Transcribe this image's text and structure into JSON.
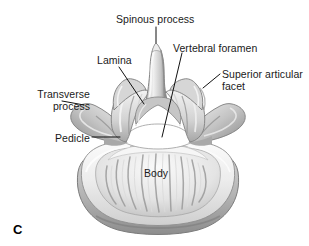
{
  "figure": {
    "panel_letter": "C",
    "background_color": "#ffffff",
    "label_color": "#1a1a1a",
    "leader_color": "#111111",
    "bone_light": "#f2f2f2",
    "bone_mid": "#c9c9c9",
    "bone_shadow": "#8f8f8f",
    "bone_dark": "#6a6a6a",
    "foramen_color": "#ffffff"
  },
  "labels": [
    {
      "id": "spinous-process",
      "text": "Spinous process",
      "lines": [
        "Spinous process"
      ],
      "align": "left",
      "x": 116,
      "y": 14
    },
    {
      "id": "lamina",
      "text": "Lamina",
      "lines": [
        "Lamina"
      ],
      "align": "left",
      "x": 97,
      "y": 55
    },
    {
      "id": "vertebral-foramen",
      "text": "Vertebral foramen",
      "lines": [
        "Vertebral foramen"
      ],
      "align": "left",
      "x": 173,
      "y": 43
    },
    {
      "id": "superior-articular-facet",
      "text": "Superior articular facet",
      "lines": [
        "Superior articular",
        "facet"
      ],
      "align": "left",
      "x": 222,
      "y": 69
    },
    {
      "id": "transverse-process",
      "text": "Transverse process",
      "lines": [
        "Transverse",
        "process"
      ],
      "align": "right",
      "x": 10,
      "y": 89
    },
    {
      "id": "pedicle",
      "text": "Pedicle",
      "lines": [
        "Pedicle"
      ],
      "align": "left",
      "x": 55,
      "y": 133
    },
    {
      "id": "body",
      "text": "Body",
      "lines": [
        "Body"
      ],
      "align": "left",
      "x": 144,
      "y": 168
    }
  ],
  "leader_lines": [
    {
      "id": "leader-spinous-process",
      "x1": 156,
      "y1": 27,
      "x2": 156,
      "y2": 43
    },
    {
      "id": "leader-lamina",
      "x1": 119,
      "y1": 67,
      "x2": 144,
      "y2": 104
    },
    {
      "id": "leader-vertebral-foramen",
      "x1": 182,
      "y1": 53,
      "x2": 162,
      "y2": 137
    },
    {
      "id": "leader-superior-articular-facet",
      "x1": 220,
      "y1": 74,
      "x2": 203,
      "y2": 88
    },
    {
      "id": "leader-transverse-process",
      "x1": 62,
      "y1": 101,
      "x2": 84,
      "y2": 105
    },
    {
      "id": "leader-pedicle",
      "x1": 92,
      "y1": 137,
      "x2": 120,
      "y2": 137
    }
  ]
}
